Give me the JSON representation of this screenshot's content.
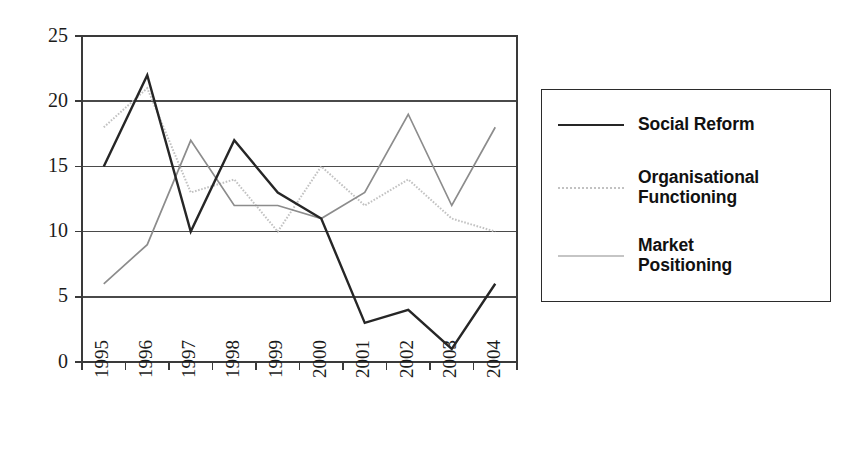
{
  "chart_data": {
    "type": "line",
    "title": "",
    "subtitle": "",
    "xlabel": "",
    "ylabel": "",
    "categories": [
      "1995",
      "1996",
      "1997",
      "1998",
      "1999",
      "2000",
      "2001",
      "2002",
      "2003",
      "2004"
    ],
    "x_tick_rotation": -90,
    "ylim": [
      0,
      25
    ],
    "y_ticks": [
      0,
      5,
      10,
      15,
      20,
      25
    ],
    "y_tick_labels": [
      "0",
      "5",
      "10",
      "15",
      "20",
      "25"
    ],
    "grid": "horizontal",
    "legend_position": "right",
    "series": [
      {
        "name": "Social Reform",
        "values": [
          15,
          22,
          10,
          17,
          13,
          11,
          3,
          4,
          1,
          6
        ],
        "color": "#262626",
        "line_style": "solid",
        "line_width": 2.4
      },
      {
        "name": "Organisational Functioning",
        "values": [
          18,
          21,
          13,
          14,
          10,
          15,
          12,
          14,
          11,
          10
        ],
        "color": "#c2c2c2",
        "line_style": "dotted",
        "line_width": 2.0
      },
      {
        "name": "Market Positioning",
        "values": [
          6,
          9,
          17,
          12,
          12,
          11,
          13,
          19,
          12,
          18
        ],
        "color": "#8c8c8c",
        "line_style": "solid",
        "line_width": 1.7
      }
    ]
  },
  "legend": {
    "entries": [
      {
        "label": "Social Reform",
        "swatch": "solid-dark-line-swatch"
      },
      {
        "label": "Organisational\nFunctioning",
        "swatch": "dotted-light-line-swatch"
      },
      {
        "label": "Market\nPositioning",
        "swatch": "solid-mid-line-swatch"
      }
    ]
  },
  "axes": {
    "y_tick_labels": [
      "25",
      "20",
      "15",
      "10",
      "5",
      "0"
    ],
    "x_tick_labels": [
      "1995",
      "1996",
      "1997",
      "1998",
      "1999",
      "2000",
      "2001",
      "2002",
      "2003",
      "2004"
    ]
  }
}
